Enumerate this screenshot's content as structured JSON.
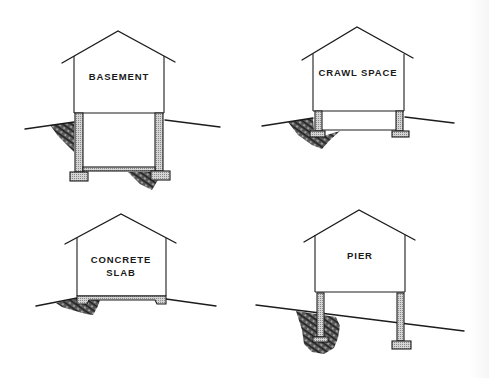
{
  "figure": {
    "colors": {
      "line": "#1c1c1c",
      "concrete_fill": "#bdbdbd",
      "soil_fill": "#3a3a3a",
      "background": "#ffffff"
    },
    "panels": [
      {
        "id": "basement",
        "label_lines": [
          "BASEMENT"
        ]
      },
      {
        "id": "crawl-space",
        "label_lines": [
          "CRAWL SPACE"
        ]
      },
      {
        "id": "concrete-slab",
        "label_lines": [
          "CONCRETE",
          "SLAB"
        ]
      },
      {
        "id": "pier",
        "label_lines": [
          "PIER"
        ]
      }
    ]
  }
}
